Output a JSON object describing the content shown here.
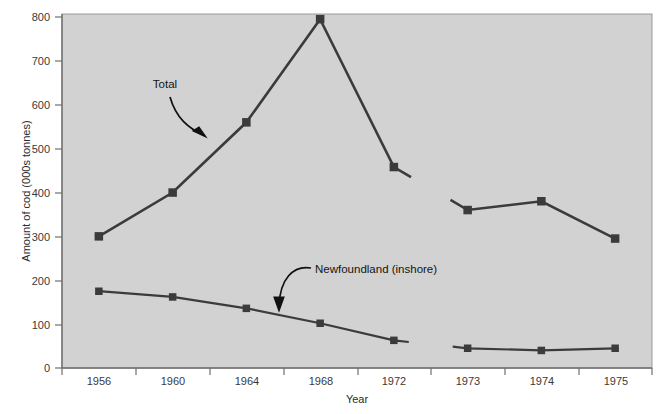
{
  "chart_data": {
    "type": "line",
    "title": "",
    "xlabel": "Year",
    "ylabel": "Amount of cod (000s tonnes)",
    "categories": [
      "1956",
      "1960",
      "1964",
      "1968",
      "1972",
      "1973",
      "1974",
      "1975"
    ],
    "ylim": [
      0,
      800
    ],
    "yticks": [
      0,
      100,
      200,
      300,
      400,
      500,
      600,
      700,
      800
    ],
    "ytick_labels": [
      "0",
      "100",
      "200",
      "300",
      "400",
      "500",
      "600",
      "700",
      "800"
    ],
    "grid": false,
    "legend": "none",
    "series_break_after_category": "1972",
    "series": [
      {
        "name": "Total",
        "values": [
          300,
          400,
          560,
          795,
          458,
          360,
          380,
          295
        ],
        "color": "#3b3b3b",
        "marker": "square"
      },
      {
        "name": "Newfoundland (inshore)",
        "values": [
          175,
          162,
          136,
          102,
          63,
          45,
          40,
          45
        ],
        "color": "#3b3b3b",
        "marker": "square"
      }
    ],
    "annotations": [
      {
        "text": "Total",
        "points_to_series": "Total",
        "x": 165,
        "y": 88
      },
      {
        "text": "Newfoundland (inshore)",
        "points_to_series": "Newfoundland (inshore)",
        "x": 315,
        "y": 269
      }
    ],
    "colors": {
      "plot_background": "#d2d2d2",
      "figure_background": "#ffffff",
      "line": "#3b3b3b",
      "marker": "#3b3b3b",
      "axis": "#6e6e6e",
      "text": "#1a1a1a"
    }
  }
}
